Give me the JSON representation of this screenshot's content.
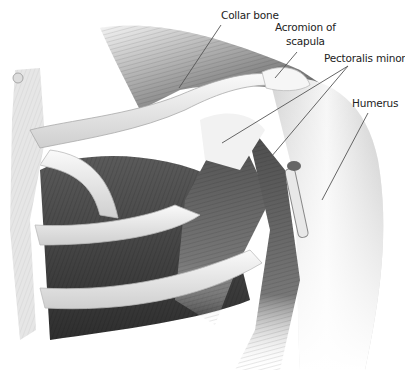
{
  "figure": {
    "labels": [
      {
        "id": "collar-bone",
        "text": "Collar bone"
      },
      {
        "id": "acromion",
        "text_line1": "Acromion of",
        "text_line2": "scapula"
      },
      {
        "id": "pectoralis-minor",
        "text": "Pectoralis minor"
      },
      {
        "id": "humerus",
        "text": "Humerus"
      }
    ],
    "colors": {
      "background": "#ffffff",
      "label_text": "#222222",
      "leader_line": "#555555",
      "bone": "#efefef",
      "muscle_dark": "#3c3c3c",
      "muscle_mid": "#7a7a7a"
    }
  }
}
